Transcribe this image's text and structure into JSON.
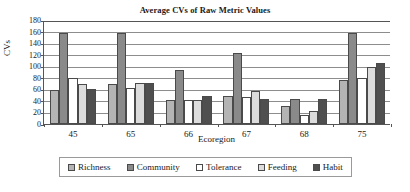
{
  "chart_data": {
    "type": "bar",
    "title": "Average CVs of Raw Metric Values",
    "xlabel": "Ecoregion",
    "ylabel": "CVs",
    "ylim": [
      0,
      180
    ],
    "ytick_step": 20,
    "yticks": [
      0,
      20,
      40,
      60,
      80,
      100,
      120,
      140,
      160,
      180
    ],
    "grid": true,
    "legend_position": "bottom",
    "categories": [
      "45",
      "65",
      "66",
      "67",
      "68",
      "75"
    ],
    "series": [
      {
        "name": "Richness",
        "color": "#b4b4b4",
        "values": [
          59,
          70,
          41,
          49,
          31,
          77
        ]
      },
      {
        "name": "Community",
        "color": "#8a8a8a",
        "values": [
          157,
          157,
          93,
          123,
          43,
          157
        ]
      },
      {
        "name": "Tolerance",
        "color": "#ffffff",
        "values": [
          79,
          63,
          41,
          46,
          15,
          79
        ]
      },
      {
        "name": "Feeding",
        "color": "#dcdcdc",
        "values": [
          69,
          71,
          41,
          57,
          22,
          99
        ]
      },
      {
        "name": "Habit",
        "color": "#4f4f4f",
        "values": [
          60,
          71,
          49,
          43,
          43,
          106
        ]
      }
    ]
  },
  "legend": {
    "items": [
      {
        "label": "Richness"
      },
      {
        "label": "Community"
      },
      {
        "label": "Tolerance"
      },
      {
        "label": "Feeding"
      },
      {
        "label": "Habit"
      }
    ]
  }
}
